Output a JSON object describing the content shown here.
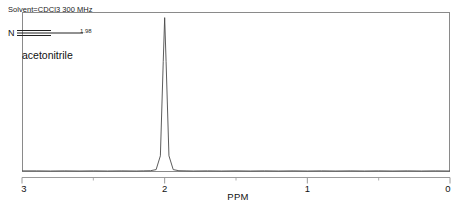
{
  "figure": {
    "annotation": {
      "solvent_line": "Solvent=CDCl3 300 MHz",
      "compound_name": "acetonitrile",
      "integral_label": "1.98",
      "atom_label": "N"
    },
    "axis": {
      "title": "PPM",
      "tick_labels": [
        "3",
        "2",
        "1",
        "0"
      ],
      "minor_ticks": [
        "2.5",
        "1.5",
        "0.5"
      ]
    },
    "colors": {
      "frame": "#8a8a8a",
      "trace": "#4a4a4a",
      "axis": "#9a9a9a",
      "text": "#111111"
    }
  },
  "chart_data": {
    "type": "line",
    "title": "",
    "subtitle": "Solvent=CDCl3 300 MHz",
    "xlabel": "PPM",
    "ylabel": "",
    "xlim": [
      3,
      0
    ],
    "ylim": [
      0,
      1
    ],
    "x_reversed": true,
    "grid": false,
    "legend": null,
    "annotations": [
      {
        "text": "acetonitrile",
        "kind": "compound-name"
      },
      {
        "text": "1.98",
        "kind": "integral",
        "peak_ppm": 2.0
      },
      {
        "text": "N",
        "kind": "atom-label"
      }
    ],
    "xticks": [
      3,
      2.5,
      2,
      1.5,
      1,
      0.5,
      0
    ],
    "xticklabels": [
      "3",
      "",
      "2",
      "",
      "1",
      "",
      "0"
    ],
    "peaks": [
      {
        "ppm": 2.0,
        "relative_height": 0.98,
        "integral": 1.98,
        "assignment": "CH3"
      }
    ],
    "series": [
      {
        "name": "1H NMR trace",
        "points": [
          [
            3.0,
            0.004
          ],
          [
            2.9,
            0.004
          ],
          [
            2.8,
            0.003
          ],
          [
            2.7,
            0.004
          ],
          [
            2.6,
            0.003
          ],
          [
            2.5,
            0.004
          ],
          [
            2.4,
            0.003
          ],
          [
            2.3,
            0.004
          ],
          [
            2.2,
            0.003
          ],
          [
            2.15,
            0.004
          ],
          [
            2.1,
            0.005
          ],
          [
            2.06,
            0.012
          ],
          [
            2.03,
            0.1
          ],
          [
            2.01,
            0.7
          ],
          [
            2.0,
            0.98
          ],
          [
            1.99,
            0.7
          ],
          [
            1.97,
            0.1
          ],
          [
            1.94,
            0.012
          ],
          [
            1.9,
            0.005
          ],
          [
            1.85,
            0.004
          ],
          [
            1.8,
            0.003
          ],
          [
            1.7,
            0.004
          ],
          [
            1.6,
            0.003
          ],
          [
            1.5,
            0.004
          ],
          [
            1.4,
            0.003
          ],
          [
            1.3,
            0.004
          ],
          [
            1.2,
            0.003
          ],
          [
            1.1,
            0.004
          ],
          [
            1.0,
            0.003
          ],
          [
            0.9,
            0.004
          ],
          [
            0.8,
            0.003
          ],
          [
            0.7,
            0.004
          ],
          [
            0.6,
            0.003
          ],
          [
            0.5,
            0.004
          ],
          [
            0.4,
            0.003
          ],
          [
            0.3,
            0.004
          ],
          [
            0.2,
            0.003
          ],
          [
            0.1,
            0.004
          ],
          [
            0.0,
            0.003
          ]
        ]
      }
    ]
  }
}
